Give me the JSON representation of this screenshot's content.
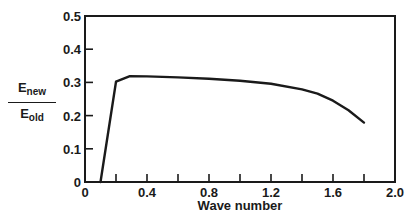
{
  "chart_data": {
    "type": "line",
    "title": "",
    "xlabel": "Wave number",
    "ylabel": "E_new / E_old",
    "ylabel_parts": {
      "numerator_base": "E",
      "numerator_sub": "new",
      "denominator_base": "E",
      "denominator_sub": "old"
    },
    "xlim": [
      0,
      2.0
    ],
    "ylim": [
      0,
      0.5
    ],
    "x_ticks": [
      0,
      0.2,
      0.4,
      0.6,
      0.8,
      1.0,
      1.2,
      1.4,
      1.6,
      1.8,
      2.0
    ],
    "x_tick_labels": [
      "0",
      "0.4",
      "0.8",
      "1.2",
      "1.6",
      "2.0"
    ],
    "x_tick_label_values": [
      0,
      0.4,
      0.8,
      1.2,
      1.6,
      2.0
    ],
    "y_ticks": [
      0,
      0.1,
      0.2,
      0.3,
      0.4,
      0.5
    ],
    "y_tick_labels": [
      "0",
      "0.1",
      "0.2",
      "0.3",
      "0.4",
      "0.5"
    ],
    "grid": false,
    "legend": null,
    "series": [
      {
        "name": "E_new/E_old",
        "x": [
          0.1,
          0.2,
          0.29,
          0.4,
          0.6,
          0.8,
          1.0,
          1.2,
          1.4,
          1.5,
          1.6,
          1.7,
          1.8
        ],
        "y": [
          0.0,
          0.302,
          0.319,
          0.318,
          0.315,
          0.311,
          0.305,
          0.296,
          0.279,
          0.266,
          0.245,
          0.216,
          0.179
        ]
      }
    ]
  }
}
